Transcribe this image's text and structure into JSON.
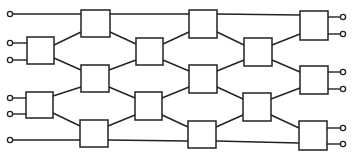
{
  "diagram": {
    "type": "switching-network",
    "colors": {
      "stroke": "#222222",
      "background": "#ffffff"
    },
    "inputs": [
      {
        "id": "in1",
        "x": 10,
        "y": 14
      },
      {
        "id": "in2",
        "x": 10,
        "y": 43
      },
      {
        "id": "in3",
        "x": 10,
        "y": 60
      },
      {
        "id": "in4",
        "x": 10,
        "y": 98
      },
      {
        "id": "in5",
        "x": 10,
        "y": 114
      },
      {
        "id": "in6",
        "x": 10,
        "y": 140
      }
    ],
    "outputs": [
      {
        "id": "out1",
        "x": 343,
        "y": 17
      },
      {
        "id": "out2",
        "x": 343,
        "y": 34
      },
      {
        "id": "out3",
        "x": 343,
        "y": 72
      },
      {
        "id": "out4",
        "x": 343,
        "y": 89
      },
      {
        "id": "out5",
        "x": 343,
        "y": 128
      },
      {
        "id": "out6",
        "x": 343,
        "y": 144
      }
    ],
    "switches": [
      {
        "id": "s1a",
        "x": 27,
        "y": 37,
        "w": 27,
        "h": 27
      },
      {
        "id": "s1b",
        "x": 26,
        "y": 92,
        "w": 27,
        "h": 26
      },
      {
        "id": "s2a",
        "x": 81,
        "y": 10,
        "w": 29,
        "h": 27
      },
      {
        "id": "s2b",
        "x": 81,
        "y": 65,
        "w": 28,
        "h": 27
      },
      {
        "id": "s2c",
        "x": 80,
        "y": 120,
        "w": 28,
        "h": 27
      },
      {
        "id": "s3a",
        "x": 136,
        "y": 38,
        "w": 27,
        "h": 27
      },
      {
        "id": "s3b",
        "x": 135,
        "y": 92,
        "w": 27,
        "h": 28
      },
      {
        "id": "s4a",
        "x": 189,
        "y": 10,
        "w": 28,
        "h": 28
      },
      {
        "id": "s4b",
        "x": 189,
        "y": 65,
        "w": 28,
        "h": 28
      },
      {
        "id": "s4c",
        "x": 188,
        "y": 121,
        "w": 28,
        "h": 27
      },
      {
        "id": "s5a",
        "x": 244,
        "y": 38,
        "w": 28,
        "h": 28
      },
      {
        "id": "s5b",
        "x": 243,
        "y": 93,
        "w": 28,
        "h": 28
      },
      {
        "id": "s6a",
        "x": 300,
        "y": 11,
        "w": 28,
        "h": 29
      },
      {
        "id": "s6b",
        "x": 300,
        "y": 66,
        "w": 28,
        "h": 28
      },
      {
        "id": "s6c",
        "x": 299,
        "y": 121,
        "w": 28,
        "h": 29
      }
    ],
    "links": [
      [
        13,
        14,
        81,
        14
      ],
      [
        13,
        43,
        27,
        43
      ],
      [
        13,
        60,
        27,
        60
      ],
      [
        13,
        98,
        26,
        98
      ],
      [
        13,
        114,
        26,
        114
      ],
      [
        13,
        140,
        80,
        140
      ],
      [
        54,
        45,
        81,
        32
      ],
      [
        54,
        58,
        81,
        70
      ],
      [
        53,
        96,
        81,
        87
      ],
      [
        53,
        113,
        80,
        126
      ],
      [
        110,
        14,
        189,
        14
      ],
      [
        110,
        32,
        136,
        44
      ],
      [
        109,
        70,
        136,
        60
      ],
      [
        109,
        87,
        135,
        98
      ],
      [
        108,
        126,
        135,
        115
      ],
      [
        108,
        140,
        188,
        141
      ],
      [
        163,
        44,
        189,
        32
      ],
      [
        163,
        60,
        189,
        71
      ],
      [
        162,
        98,
        189,
        87
      ],
      [
        162,
        115,
        188,
        127
      ],
      [
        217,
        14,
        300,
        15
      ],
      [
        217,
        32,
        244,
        45
      ],
      [
        217,
        71,
        244,
        60
      ],
      [
        217,
        87,
        243,
        99
      ],
      [
        216,
        127,
        243,
        115
      ],
      [
        216,
        141,
        299,
        143
      ],
      [
        272,
        45,
        300,
        34
      ],
      [
        272,
        60,
        300,
        72
      ],
      [
        271,
        99,
        300,
        88
      ],
      [
        271,
        115,
        299,
        128
      ],
      [
        328,
        17,
        340,
        17
      ],
      [
        328,
        34,
        340,
        34
      ],
      [
        328,
        72,
        340,
        72
      ],
      [
        328,
        89,
        340,
        89
      ],
      [
        327,
        128,
        340,
        128
      ],
      [
        327,
        144,
        340,
        144
      ]
    ]
  }
}
